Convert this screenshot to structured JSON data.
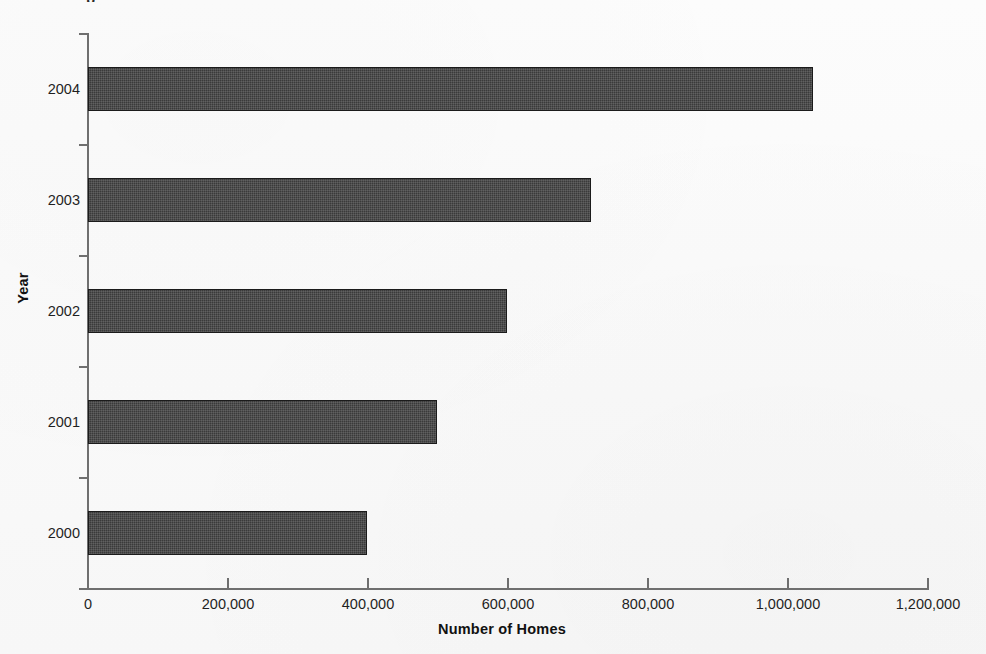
{
  "page": {
    "clipped_top_text": "p",
    "background_color": "#fbfbfb"
  },
  "chart_data": {
    "type": "bar",
    "orientation": "horizontal",
    "title": "",
    "subtitle": "",
    "xlabel": "Number of Homes",
    "ylabel": "Year",
    "categories": [
      "2000",
      "2001",
      "2002",
      "2003",
      "2004"
    ],
    "values": [
      398000,
      498000,
      598000,
      718000,
      1036000
    ],
    "series": [
      {
        "name": "Number of Homes",
        "values": [
          398000,
          498000,
          598000,
          718000,
          1036000
        ]
      }
    ],
    "xlim": [
      0,
      1200000
    ],
    "x_ticks": [
      0,
      200000,
      400000,
      600000,
      800000,
      1000000,
      1200000
    ],
    "x_tick_labels": [
      "0",
      "200,000",
      "400,000",
      "600,000",
      "800,000",
      "1,000,000",
      "1,200,000"
    ],
    "y_tick_labels": [
      "2004",
      "2003",
      "2002",
      "2001",
      "2000"
    ],
    "grid": false,
    "legend": false,
    "legend_position": "none",
    "bar_color": "#3a3a3a",
    "bar_border_color": "#1b1b1b",
    "axis_color": "#6f6f6f",
    "text_color": "#1f1f1f"
  }
}
